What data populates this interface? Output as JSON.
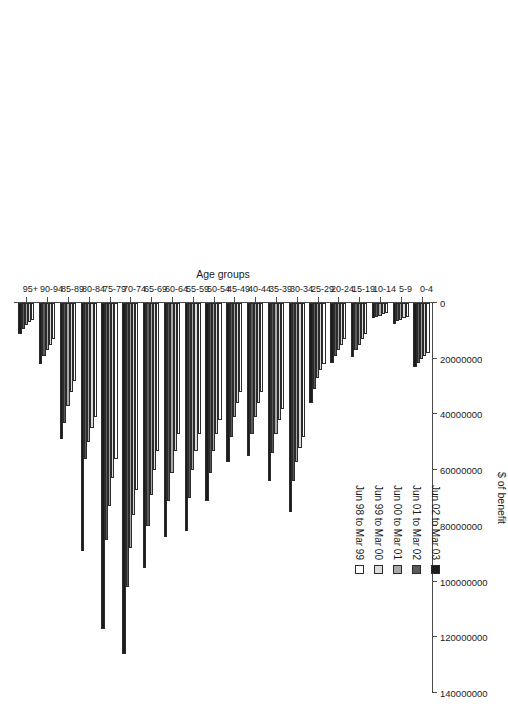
{
  "chart": {
    "type": "bar",
    "orientation": "rotated-90",
    "xlabel": "Age groups",
    "ylabel": "$ of benefit",
    "title": ""
  },
  "axes": {
    "value_axis": {
      "label": "$ of benefit",
      "min": 0,
      "max": 140000000,
      "ticks": [
        0,
        20000000,
        40000000,
        60000000,
        80000000,
        100000000,
        120000000,
        140000000
      ],
      "tick_labels": [
        "0",
        "20000000",
        "40000000",
        "60000000",
        "80000000",
        "100000000",
        "120000000",
        "140000000"
      ]
    },
    "category_axis": {
      "label": "Age groups",
      "categories": [
        "0-4",
        "5-9",
        "10-14",
        "15-19",
        "20-24",
        "25-29",
        "30-34",
        "35-39",
        "40-44",
        "45-49",
        "50-54",
        "55-59",
        "60-64",
        "65-69",
        "70-74",
        "75-79",
        "80-84",
        "85-89",
        "90-94",
        "95+"
      ]
    }
  },
  "legend": {
    "entries": [
      {
        "label": "Jun 98 to Mar 99",
        "color": "#ffffff"
      },
      {
        "label": "Jun 99 to Mar 00",
        "color": "#dcdcdc"
      },
      {
        "label": "Jun 00 to Mar 01",
        "color": "#a8a8a8"
      },
      {
        "label": "Jun 01 to Mar 02",
        "color": "#5a5a5a"
      },
      {
        "label": "Jun 02 to Mar 03",
        "color": "#1c1c1c"
      }
    ]
  },
  "chart_data": {
    "type": "bar",
    "title": "",
    "xlabel": "Age groups",
    "ylabel": "$ of benefit",
    "ylim": [
      0,
      140000000
    ],
    "grid": false,
    "legend_position": "left-center",
    "categories": [
      "0-4",
      "5-9",
      "10-14",
      "15-19",
      "20-24",
      "25-29",
      "30-34",
      "35-39",
      "40-44",
      "45-49",
      "50-54",
      "55-59",
      "60-64",
      "65-69",
      "70-74",
      "75-79",
      "80-84",
      "85-89",
      "90-94",
      "95+"
    ],
    "series": [
      {
        "name": "Jun 98 to Mar 99",
        "color": "#ffffff",
        "values": [
          18000000,
          5000000,
          3500000,
          11000000,
          13000000,
          22000000,
          48000000,
          38000000,
          32000000,
          32000000,
          42000000,
          47000000,
          47000000,
          53000000,
          67000000,
          56000000,
          41000000,
          28000000,
          13000000,
          6000000
        ]
      },
      {
        "name": "Jun 99 to Mar 00",
        "color": "#dcdcdc",
        "values": [
          19000000,
          5500000,
          4000000,
          13000000,
          15000000,
          24000000,
          52000000,
          42000000,
          36000000,
          36000000,
          47000000,
          53000000,
          53000000,
          60000000,
          76000000,
          63000000,
          45000000,
          32000000,
          15000000,
          7000000
        ]
      },
      {
        "name": "Jun 00 to Mar 01",
        "color": "#a8a8a8",
        "values": [
          20000000,
          6000000,
          4500000,
          15000000,
          17000000,
          27000000,
          57000000,
          47000000,
          41000000,
          41000000,
          53000000,
          60000000,
          61000000,
          69000000,
          88000000,
          73000000,
          50000000,
          37000000,
          17000000,
          8000000
        ]
      },
      {
        "name": "Jun 01 to Mar 02",
        "color": "#5a5a5a",
        "values": [
          21500000,
          6500000,
          5000000,
          17000000,
          19000000,
          31000000,
          64000000,
          54000000,
          47000000,
          48000000,
          61000000,
          70000000,
          71000000,
          80000000,
          102000000,
          85000000,
          56000000,
          43000000,
          19000000,
          9500000
        ]
      },
      {
        "name": "Jun 02 to Mar 03",
        "color": "#1c1c1c",
        "values": [
          23000000,
          7500000,
          5500000,
          19500000,
          21500000,
          36000000,
          75000000,
          64000000,
          55000000,
          57000000,
          71000000,
          82000000,
          84000000,
          95000000,
          126000000,
          117000000,
          89000000,
          49000000,
          22000000,
          11000000
        ]
      }
    ]
  }
}
